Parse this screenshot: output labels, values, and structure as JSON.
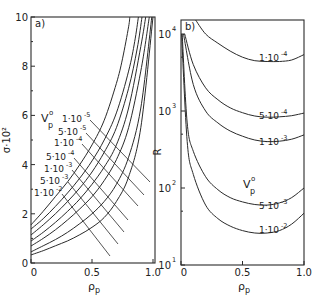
{
  "chart_data": [
    {
      "panel": "a)",
      "type": "line",
      "title": "",
      "xlabel": "ρp",
      "ylabel": "σ·10²",
      "xlim": [
        0,
        1.0
      ],
      "ylim": [
        0,
        10
      ],
      "xticks": [
        0,
        0.5,
        1.0
      ],
      "xtick_labels": [
        "0",
        "0.5",
        "1.0"
      ],
      "yticks": [
        0,
        2,
        4,
        6,
        8,
        10
      ],
      "ytick_labels": [
        "0",
        "2",
        "4",
        "6",
        "8",
        "10"
      ],
      "grid": false,
      "legend_title": "Vp°",
      "series": [
        {
          "name": "1·10⁻⁵",
          "x": [
            0,
            0.1,
            0.2,
            0.3,
            0.4,
            0.5,
            0.6,
            0.7,
            0.75,
            0.8,
            0.81
          ],
          "values": [
            1.55,
            2.1,
            2.7,
            3.3,
            4.0,
            4.8,
            5.8,
            7.3,
            8.3,
            9.6,
            10
          ]
        },
        {
          "name": "5·10⁻⁵",
          "x": [
            0,
            0.1,
            0.2,
            0.3,
            0.4,
            0.5,
            0.6,
            0.7,
            0.8,
            0.85,
            0.88
          ],
          "values": [
            1.38,
            1.8,
            2.3,
            2.85,
            3.45,
            4.15,
            5.0,
            6.1,
            7.8,
            9.0,
            10
          ]
        },
        {
          "name": "1·10⁻⁴",
          "x": [
            0,
            0.1,
            0.2,
            0.3,
            0.4,
            0.5,
            0.6,
            0.7,
            0.8,
            0.87,
            0.91
          ],
          "values": [
            1.14,
            1.55,
            2.0,
            2.5,
            3.05,
            3.7,
            4.5,
            5.5,
            7.1,
            8.7,
            10
          ]
        },
        {
          "name": "5·10⁻⁴",
          "x": [
            0,
            0.1,
            0.2,
            0.3,
            0.4,
            0.5,
            0.6,
            0.7,
            0.8,
            0.9,
            0.94
          ],
          "values": [
            0.89,
            1.25,
            1.65,
            2.1,
            2.6,
            3.2,
            3.9,
            4.8,
            6.3,
            8.8,
            10
          ]
        },
        {
          "name": "1·10⁻³",
          "x": [
            0,
            0.1,
            0.2,
            0.3,
            0.4,
            0.5,
            0.6,
            0.7,
            0.8,
            0.9,
            0.97
          ],
          "values": [
            0.69,
            1.0,
            1.35,
            1.75,
            2.2,
            2.7,
            3.35,
            4.2,
            5.5,
            7.8,
            10
          ]
        },
        {
          "name": "5·10⁻³",
          "x": [
            0,
            0.1,
            0.2,
            0.3,
            0.4,
            0.5,
            0.6,
            0.7,
            0.8,
            0.9,
            0.99
          ],
          "values": [
            0.45,
            0.7,
            0.95,
            1.25,
            1.6,
            2.0,
            2.5,
            3.2,
            4.3,
            6.3,
            10
          ]
        },
        {
          "name": "1·10⁻²",
          "x": [
            0,
            0.1,
            0.2,
            0.3,
            0.4,
            0.5,
            0.6,
            0.7,
            0.8,
            0.9,
            1.0
          ],
          "values": [
            0.33,
            0.5,
            0.7,
            0.9,
            1.15,
            1.45,
            1.85,
            2.5,
            3.5,
            5.5,
            10
          ]
        }
      ]
    },
    {
      "panel": "b)",
      "type": "line",
      "title": "",
      "xlabel": "ρp",
      "ylabel": "R",
      "xlim": [
        0,
        1.0
      ],
      "ylim": [
        10,
        16000
      ],
      "yscale": "log",
      "xticks": [
        0,
        0.5,
        1.0
      ],
      "xtick_labels": [
        "0",
        "0.5",
        "1.0"
      ],
      "yticks": [
        10,
        100,
        1000,
        10000
      ],
      "ytick_labels": [
        "10¹",
        "10²",
        "10³",
        "10⁴"
      ],
      "grid": false,
      "legend_title": "Vp°",
      "series": [
        {
          "name": "1·10⁻⁴",
          "x": [
            0.11,
            0.2,
            0.3,
            0.4,
            0.5,
            0.6,
            0.7,
            0.8,
            0.9,
            1.0
          ],
          "values": [
            16000,
            10000,
            7600,
            6000,
            5000,
            4500,
            4400,
            4400,
            4600,
            5400
          ]
        },
        {
          "name": "5·10⁻⁴",
          "x": [
            0.03,
            0.1,
            0.2,
            0.3,
            0.4,
            0.5,
            0.6,
            0.7,
            0.8,
            0.9,
            1.0
          ],
          "values": [
            10000,
            4000,
            2000,
            1400,
            1100,
            950,
            860,
            830,
            840,
            870,
            940
          ]
        },
        {
          "name": "1·10⁻³",
          "x": [
            0.02,
            0.1,
            0.2,
            0.3,
            0.4,
            0.5,
            0.6,
            0.7,
            0.8,
            0.9,
            1.0
          ],
          "values": [
            10000,
            2200,
            1000,
            700,
            550,
            470,
            420,
            400,
            405,
            430,
            490
          ]
        },
        {
          "name": "5·10⁻³",
          "x": [
            0.01,
            0.05,
            0.1,
            0.2,
            0.3,
            0.4,
            0.5,
            0.6,
            0.7,
            0.8,
            0.9,
            1.0
          ],
          "values": [
            10000,
            700,
            300,
            140,
            95,
            75,
            66,
            61,
            60,
            64,
            75,
            100
          ]
        },
        {
          "name": "1·10⁻²",
          "x": [
            0.005,
            0.05,
            0.1,
            0.2,
            0.3,
            0.4,
            0.5,
            0.6,
            0.7,
            0.8,
            0.9,
            1.0
          ],
          "values": [
            10000,
            400,
            150,
            60,
            40,
            32,
            28,
            26,
            26,
            28,
            34,
            47
          ]
        }
      ]
    }
  ],
  "panels": {
    "a": {
      "label": "a)",
      "ylabel": "σ·10²",
      "xlabel": "ρ",
      "xlabel_sub": "p",
      "legend_title": "V",
      "legend_title_sup": "o",
      "legend_title_sub": "p",
      "curve_labels": [
        "1·10",
        "5·10",
        "1·10",
        "5·10",
        "1·10",
        "5·10",
        "1·10"
      ],
      "curve_label_exps": [
        "-5",
        "-5",
        "-4",
        "-4",
        "-3",
        "-3",
        "-2"
      ]
    },
    "b": {
      "label": "b)",
      "ylabel": "R",
      "xlabel": "ρ",
      "xlabel_sub": "p",
      "legend_title": "V",
      "legend_title_sup": "o",
      "legend_title_sub": "p",
      "curve_labels": [
        "1·10",
        "5·10",
        "1·10",
        "5·10",
        "1·10"
      ],
      "curve_label_exps": [
        "-4",
        "-4",
        "-3",
        "-3",
        "-2"
      ]
    }
  },
  "style": {
    "ink": "#2a2a2a",
    "background": "#ffffff"
  }
}
